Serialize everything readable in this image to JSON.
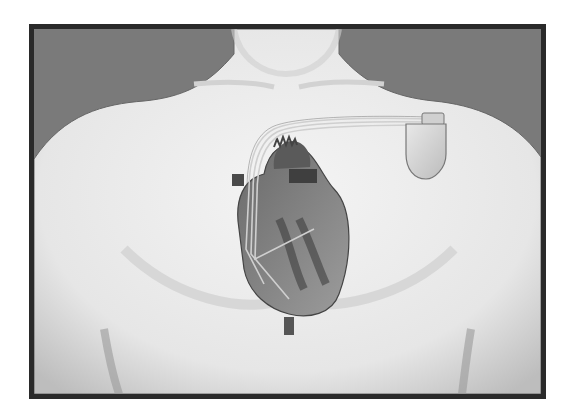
{
  "image": {
    "subject": "Illustration of a human chest with an implanted pacemaker connected by leads to the heart",
    "style": "grayscale medical illustration",
    "elements": [
      "torso",
      "neck",
      "heart",
      "pacemaker",
      "leads"
    ],
    "colors": {
      "frame": "#2a2a2a",
      "background": "#7a7a7a",
      "skin": "#ececec",
      "heart_dark": "#555555",
      "heart_light": "#9a9a9a",
      "device": "#d8d8d8"
    }
  }
}
